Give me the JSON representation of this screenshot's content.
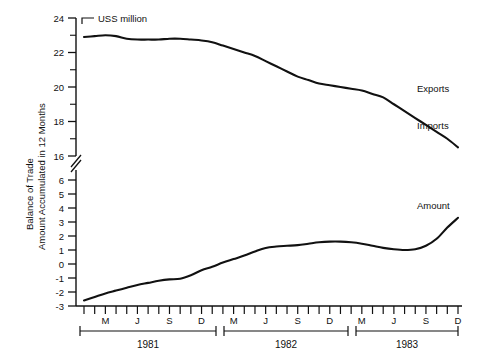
{
  "chart_data": {
    "type": "line",
    "title": "",
    "unit_label": "USS million",
    "ylabel": "Balance of Trade\nAmount Accumulated in 12 Months",
    "ylabel_line1": "Balance of Trade",
    "ylabel_line2": "Amount Accumulated in 12 Months",
    "xlabel": "",
    "grid": false,
    "legend_position": "right-inline",
    "axis_break": true,
    "axis_break_between": [
      16,
      6
    ],
    "upper_ticks": [
      24,
      22,
      20,
      18,
      16
    ],
    "upper_tick_labels": [
      "24",
      "22",
      "20",
      "18",
      "16"
    ],
    "lower_ticks": [
      6,
      5,
      4,
      3,
      2,
      1,
      0,
      -1,
      -2,
      -3
    ],
    "lower_tick_labels": [
      "6",
      "5",
      "4",
      "3",
      "2",
      "1",
      "0",
      "-1",
      "-2",
      "-3"
    ],
    "upper_ylim": [
      16,
      24
    ],
    "lower_ylim": [
      -3,
      6
    ],
    "month_tick_labels": [
      "",
      "",
      "M",
      "",
      "",
      "J",
      "",
      "",
      "S",
      "",
      "",
      "D",
      "",
      "",
      "M",
      "",
      "",
      "J",
      "",
      "",
      "S",
      "",
      "",
      "D",
      "",
      "",
      "M",
      "",
      "",
      "J",
      "",
      "",
      "S",
      "",
      "",
      "D"
    ],
    "years": [
      "1981",
      "1982",
      "1983"
    ],
    "x": [
      1,
      2,
      3,
      4,
      5,
      6,
      7,
      8,
      9,
      10,
      11,
      12,
      13,
      14,
      15,
      16,
      17,
      18,
      19,
      20,
      21,
      22,
      23,
      24,
      25,
      26,
      27,
      28,
      29,
      30,
      31,
      32,
      33,
      34,
      35,
      36
    ],
    "series": [
      {
        "name": "Exports",
        "label": "Exports",
        "scale": "upper",
        "values": [
          22.9,
          22.95,
          23.0,
          22.95,
          22.8,
          22.75,
          22.75,
          22.75,
          22.8,
          22.8,
          22.75,
          22.7,
          22.6,
          22.4,
          22.2,
          22.0,
          21.8,
          21.5,
          21.2,
          20.9,
          20.6,
          20.4,
          20.2,
          20.1,
          20.0,
          19.9,
          19.8,
          19.6,
          19.4,
          19.0,
          18.6,
          18.2,
          17.8,
          17.4,
          17.0,
          16.5
        ]
      },
      {
        "name": "Imports",
        "label": "Imports",
        "scale": "upper",
        "note": "Imports label marks the terminal end of the descending upper curve"
      },
      {
        "name": "Amount",
        "label": "Amount",
        "scale": "lower",
        "values": [
          -2.6,
          -2.35,
          -2.1,
          -1.9,
          -1.7,
          -1.5,
          -1.35,
          -1.2,
          -1.1,
          -1.05,
          -0.8,
          -0.45,
          -0.2,
          0.1,
          0.35,
          0.6,
          0.9,
          1.15,
          1.25,
          1.3,
          1.35,
          1.45,
          1.55,
          1.6,
          1.6,
          1.55,
          1.45,
          1.3,
          1.15,
          1.05,
          1.0,
          1.05,
          1.3,
          1.8,
          2.6,
          3.3
        ]
      }
    ],
    "annotations": [
      {
        "text": "Exports",
        "series": "Exports"
      },
      {
        "text": "Imports",
        "series": "Imports"
      },
      {
        "text": "Amount",
        "series": "Amount"
      }
    ]
  }
}
